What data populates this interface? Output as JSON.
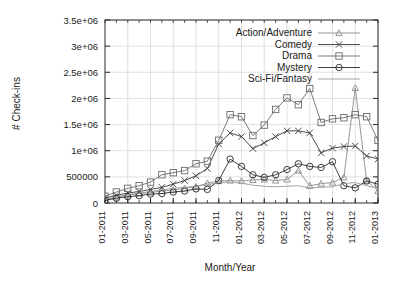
{
  "chart_data": {
    "type": "line",
    "title": "",
    "xlabel": "Month/Year",
    "ylabel": "# Check-ins",
    "grid": true,
    "legend_position": "top-right",
    "xlim": [
      0,
      24
    ],
    "ylim": [
      0,
      3500000
    ],
    "ytick_values": [
      0,
      500000,
      1000000,
      1500000,
      2000000,
      2500000,
      3000000,
      3500000
    ],
    "ytick_labels": [
      "0",
      "500000",
      "1e+06",
      "1.5e+06",
      "2e+06",
      "2.5e+06",
      "3e+06",
      "3.5e+06"
    ],
    "xtick_indices": [
      0,
      2,
      4,
      6,
      8,
      10,
      12,
      14,
      16,
      18,
      20,
      22,
      24
    ],
    "xtick_labels": [
      "01-2011",
      "03-2011",
      "05-2011",
      "07-2011",
      "09-2011",
      "11-2011",
      "01-2012",
      "03-2012",
      "05-2012",
      "07-2012",
      "09-2012",
      "11-2012",
      "01-2013"
    ],
    "x": [
      0,
      1,
      2,
      3,
      4,
      5,
      6,
      7,
      8,
      9,
      10,
      11,
      12,
      13,
      14,
      15,
      16,
      17,
      18,
      19,
      20,
      21,
      22,
      23,
      24
    ],
    "series": [
      {
        "name": "Action/Adventure",
        "marker": "triangle",
        "color": "#8a8a8a",
        "values": [
          60000,
          110000,
          150000,
          180000,
          200000,
          230000,
          250000,
          280000,
          310000,
          380000,
          420000,
          430000,
          420000,
          440000,
          450000,
          430000,
          450000,
          620000,
          330000,
          370000,
          390000,
          490000,
          2200000,
          430000,
          230000
        ]
      },
      {
        "name": "Comedy",
        "marker": "x",
        "color": "#3a3a3a",
        "values": [
          90000,
          150000,
          190000,
          220000,
          260000,
          300000,
          360000,
          430000,
          520000,
          660000,
          1130000,
          1340000,
          1270000,
          1040000,
          1150000,
          1270000,
          1380000,
          1380000,
          1340000,
          960000,
          1050000,
          1080000,
          1090000,
          900000,
          840000
        ]
      },
      {
        "name": "Drama",
        "marker": "square",
        "color": "#6b6b6b",
        "values": [
          130000,
          210000,
          280000,
          330000,
          400000,
          540000,
          580000,
          620000,
          750000,
          800000,
          1200000,
          1690000,
          1650000,
          1290000,
          1490000,
          1790000,
          2010000,
          1880000,
          2190000,
          1540000,
          1610000,
          1630000,
          1690000,
          1650000,
          1200000
        ]
      },
      {
        "name": "Mystery",
        "marker": "circle",
        "color": "#2a2a2a",
        "values": [
          50000,
          90000,
          120000,
          140000,
          170000,
          180000,
          210000,
          230000,
          270000,
          260000,
          430000,
          840000,
          700000,
          540000,
          490000,
          540000,
          640000,
          750000,
          700000,
          680000,
          790000,
          330000,
          290000,
          420000,
          360000
        ]
      },
      {
        "name": "Sci-Fi/Fantasy",
        "marker": "none",
        "color": "#9a9a9a",
        "values": [
          70000,
          120000,
          160000,
          190000,
          220000,
          250000,
          280000,
          300000,
          320000,
          350000,
          390000,
          400000,
          380000,
          340000,
          320000,
          310000,
          320000,
          330000,
          290000,
          300000,
          310000,
          370000,
          390000,
          330000,
          280000
        ]
      }
    ]
  },
  "legend": {
    "entries": [
      {
        "label": "Action/Adventure",
        "marker": "triangle"
      },
      {
        "label": "Comedy",
        "marker": "x"
      },
      {
        "label": "Drama",
        "marker": "square"
      },
      {
        "label": "Mystery",
        "marker": "circle"
      },
      {
        "label": "Sci-Fi/Fantasy",
        "marker": "none"
      }
    ]
  }
}
